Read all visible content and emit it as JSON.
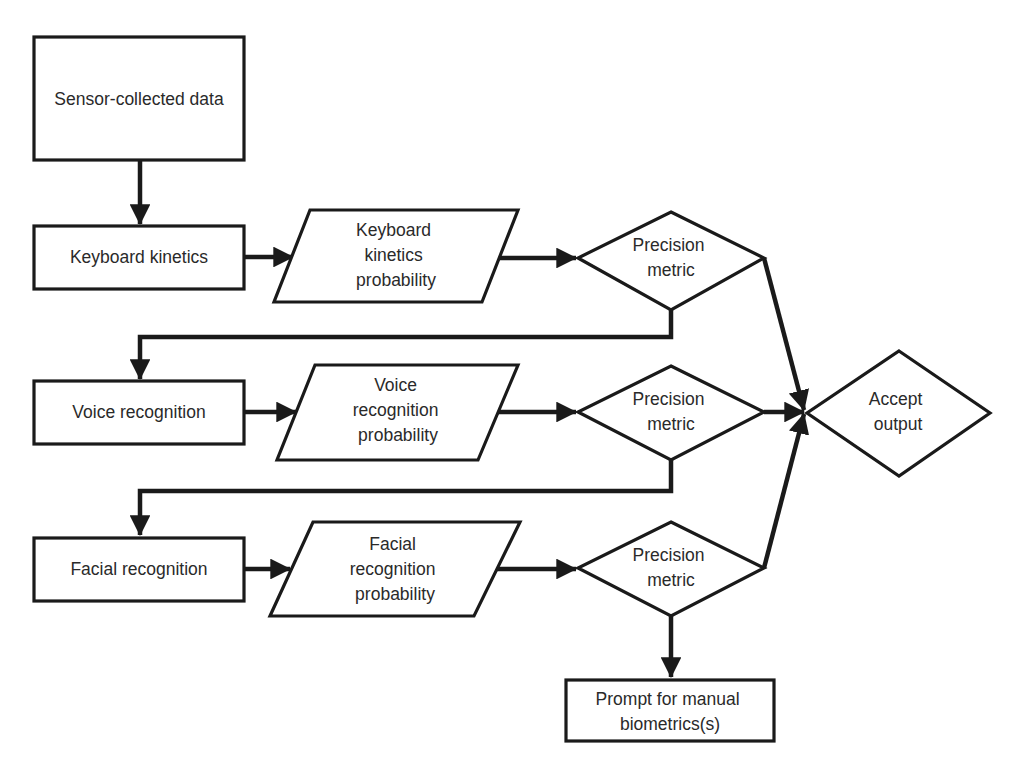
{
  "diagram": {
    "type": "flowchart",
    "colors": {
      "stroke": "#1a1a1a",
      "fill": "#ffffff",
      "text": "#2a2a2a",
      "background": "#ffffff"
    },
    "nodes": {
      "sensor": {
        "shape": "rectangle",
        "lines": [
          "Sensor-collected data"
        ]
      },
      "keyboard": {
        "shape": "rectangle",
        "lines": [
          "Keyboard kinetics"
        ]
      },
      "keyboard_prob": {
        "shape": "parallelogram",
        "lines": [
          "Keyboard",
          "kinetics",
          "probability"
        ]
      },
      "precision1": {
        "shape": "diamond",
        "lines": [
          "Precision",
          "metric"
        ]
      },
      "voice": {
        "shape": "rectangle",
        "lines": [
          "Voice recognition"
        ]
      },
      "voice_prob": {
        "shape": "parallelogram",
        "lines": [
          "Voice",
          "recognition",
          "probability"
        ]
      },
      "precision2": {
        "shape": "diamond",
        "lines": [
          "Precision",
          "metric"
        ]
      },
      "accept": {
        "shape": "diamond",
        "lines": [
          "Accept",
          "output"
        ]
      },
      "facial": {
        "shape": "rectangle",
        "lines": [
          "Facial recognition"
        ]
      },
      "facial_prob": {
        "shape": "parallelogram",
        "lines": [
          "Facial",
          "recognition",
          "probability"
        ]
      },
      "precision3": {
        "shape": "diamond",
        "lines": [
          "Precision",
          "metric"
        ]
      },
      "prompt": {
        "shape": "rectangle",
        "lines": [
          "Prompt for manual",
          "biometrics(s)"
        ]
      }
    },
    "edges": [
      {
        "from": "sensor",
        "to": "keyboard"
      },
      {
        "from": "keyboard",
        "to": "keyboard_prob"
      },
      {
        "from": "keyboard_prob",
        "to": "precision1"
      },
      {
        "from": "precision1",
        "to": "accept"
      },
      {
        "from": "precision1",
        "to": "voice"
      },
      {
        "from": "voice",
        "to": "voice_prob"
      },
      {
        "from": "voice_prob",
        "to": "precision2"
      },
      {
        "from": "precision2",
        "to": "accept"
      },
      {
        "from": "precision2",
        "to": "facial"
      },
      {
        "from": "facial",
        "to": "facial_prob"
      },
      {
        "from": "facial_prob",
        "to": "precision3"
      },
      {
        "from": "precision3",
        "to": "accept"
      },
      {
        "from": "precision3",
        "to": "prompt"
      }
    ]
  }
}
